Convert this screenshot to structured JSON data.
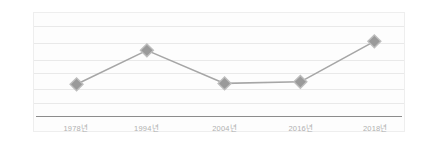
{
  "chart_data": {
    "type": "line",
    "title": "",
    "subtitle": "",
    "xlabel": "",
    "ylabel": "",
    "categories": [
      "1978년",
      "1994년",
      "2004년",
      "2016년",
      "2018년"
    ],
    "values": [
      28,
      69,
      29,
      31,
      80
    ],
    "series": [
      {
        "name": "",
        "values": [
          28,
          69,
          29,
          31,
          80
        ]
      }
    ],
    "ylim": [
      0,
      100
    ],
    "grid": true,
    "gridline_count": 6,
    "legend": "none",
    "legend_position": "none",
    "marker_shape": "diamond",
    "colors": {
      "line": "#a6a6a6",
      "marker_fill": "#9a9a9a",
      "marker_stroke": "#bdbdbd",
      "gridline": "#e9e9e9",
      "axis": "#8c8c8c",
      "tick_label": "#b0b0b0",
      "panel_background": "#fdfdfd",
      "panel_border": "#eeeeee",
      "page_background": "#ffffff"
    },
    "annotations": []
  },
  "axis": {
    "ticks": [
      {
        "label": "1978년",
        "x_pct": 11.5
      },
      {
        "label": "1994년",
        "x_pct": 30.5
      },
      {
        "label": "2004년",
        "x_pct": 51.5
      },
      {
        "label": "2016년",
        "x_pct": 72.0
      },
      {
        "label": "2018년",
        "x_pct": 92.0
      }
    ]
  }
}
